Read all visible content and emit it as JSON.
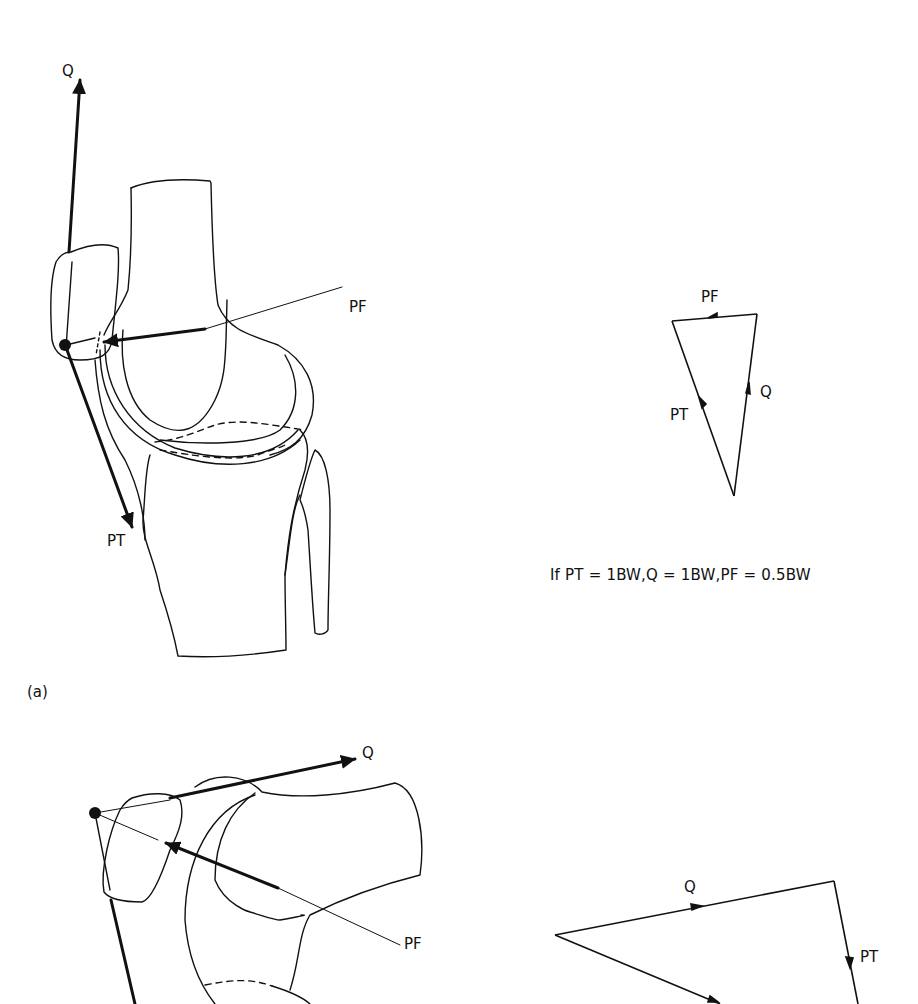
{
  "figure": {
    "panel_a": {
      "panel_label": "(a)",
      "knee_diagram": {
        "labels": {
          "quadriceps": "Q",
          "patellofemoral": "PF",
          "patellar_tendon": "PT"
        }
      },
      "force_triangle": {
        "labels": {
          "patellofemoral": "PF",
          "quadriceps": "Q",
          "patellar_tendon": "PT"
        }
      },
      "caption": "If PT = 1BW,Q = 1BW,PF = 0.5BW"
    },
    "panel_b": {
      "knee_diagram": {
        "labels": {
          "quadriceps": "Q",
          "patellofemoral": "PF"
        }
      },
      "force_triangle": {
        "labels": {
          "quadriceps": "Q",
          "patellar_tendon": "PT"
        }
      }
    },
    "colors": {
      "ink": "#111111",
      "background": "#ffffff"
    }
  }
}
